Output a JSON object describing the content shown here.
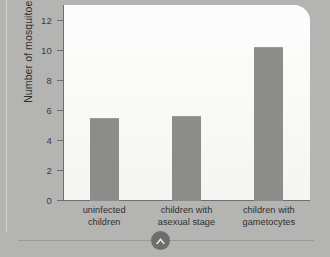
{
  "chart_data": {
    "type": "bar",
    "title": "",
    "xlabel": "",
    "ylabel": "Number of mosquitoes",
    "ylim": [
      0,
      13
    ],
    "yticks": [
      0,
      2,
      4,
      6,
      8,
      10,
      12
    ],
    "ytick_labels": [
      "0",
      "2",
      "4",
      "6",
      "8",
      "10",
      "12"
    ],
    "grid": false,
    "legend": "none",
    "bar_color": "#8c8c8b",
    "plot_background": "#fbfbfa",
    "figure_background": "#b4b4b3",
    "axis_color": "#6f6f6e",
    "categories": [
      "uninfected children",
      "children with asexual stage",
      "children with gametocytes"
    ],
    "category_lines": [
      [
        "uninfected",
        "children"
      ],
      [
        "children with",
        "asexual stage"
      ],
      [
        "children with",
        "gametocytes"
      ]
    ],
    "values": [
      5.5,
      5.6,
      10.2
    ]
  },
  "footer": {
    "badge_icon": "chevron-up-icon"
  }
}
